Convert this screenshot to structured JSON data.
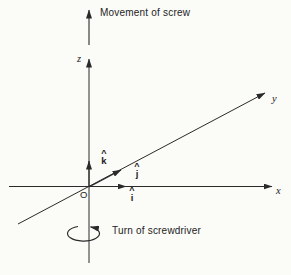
{
  "figure": {
    "background": "#fbfbf8",
    "ink_color": "#2a2a2a",
    "captions": {
      "movement": "Movement of screw",
      "turn": "Turn of screwdriver"
    },
    "axes": {
      "x_label": "x",
      "y_label": "y",
      "z_label": "z",
      "origin_label": "O"
    },
    "unit_vectors": {
      "hat": "^",
      "i_letter": "i",
      "j_letter": "j",
      "k_letter": "k"
    }
  }
}
